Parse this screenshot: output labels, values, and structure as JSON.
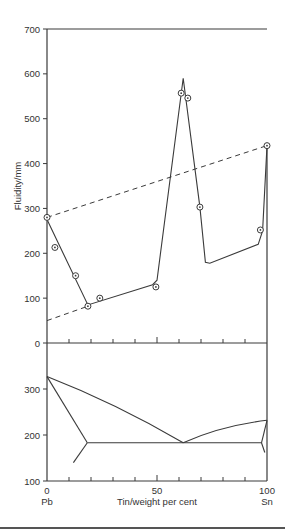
{
  "chart_data": [
    {
      "type": "scatter",
      "title": "",
      "xlabel": "Tin/weight per cent",
      "ylabel": "Fluidity/mm",
      "xlim": [
        0,
        100
      ],
      "ylim": [
        0,
        700
      ],
      "yticks": [
        0,
        100,
        200,
        300,
        400,
        500,
        600,
        700
      ],
      "ytick_labels": [
        "0",
        "100",
        "200",
        "300",
        "400",
        "500",
        "600",
        "700"
      ],
      "xticks": [
        0,
        10,
        20,
        30,
        40,
        50,
        60,
        70,
        80,
        90,
        100
      ],
      "grid": false,
      "series": [
        {
          "name": "measured fluidity",
          "style": "markers",
          "x": [
            0,
            3.6,
            13,
            18.6,
            24,
            49.5,
            61,
            64,
            69.5,
            97,
            100
          ],
          "y": [
            280,
            213,
            150,
            82,
            100,
            125,
            557,
            546,
            303,
            252,
            440
          ]
        },
        {
          "name": "fluidity curve",
          "style": "solid",
          "x": [
            0,
            18.6,
            48,
            50,
            61.9,
            69.5,
            72,
            74,
            96,
            98,
            100
          ],
          "y": [
            275,
            85,
            130,
            140,
            590,
            303,
            180,
            178,
            220,
            250,
            440
          ]
        },
        {
          "name": "upper linear trend",
          "style": "dashed",
          "x": [
            0,
            100
          ],
          "y": [
            280,
            440
          ]
        },
        {
          "name": "lower linear trend",
          "style": "dashed",
          "x": [
            0,
            18.6
          ],
          "y": [
            50,
            82
          ]
        }
      ]
    },
    {
      "type": "line",
      "title": "Pb-Sn phase diagram",
      "xlabel": "Tin/weight per cent",
      "ylabel": "",
      "xlim": [
        0,
        100
      ],
      "ylim": [
        100,
        350
      ],
      "yticks": [
        100,
        200,
        300
      ],
      "ytick_labels": [
        "100",
        "200",
        "300"
      ],
      "xticks": [
        0,
        10,
        20,
        30,
        40,
        50,
        60,
        70,
        80,
        90,
        100
      ],
      "xtick_labels": [
        "0",
        "50",
        "100"
      ],
      "x_end_labels": [
        "Pb",
        "Sn"
      ],
      "grid": false,
      "series": [
        {
          "name": "liquidus Pb side",
          "x": [
            0,
            61.9
          ],
          "y": [
            327,
            183
          ]
        },
        {
          "name": "liquidus Sn side",
          "x": [
            61.9,
            100
          ],
          "y": [
            183,
            232
          ]
        },
        {
          "name": "solidus Pb side",
          "x": [
            0,
            18.3
          ],
          "y": [
            327,
            183
          ]
        },
        {
          "name": "solvus Pb side",
          "x": [
            18.3,
            12
          ],
          "y": [
            183,
            140
          ]
        },
        {
          "name": "eutectic line",
          "x": [
            18.3,
            97.5
          ],
          "y": [
            183,
            183
          ]
        },
        {
          "name": "solidus Sn side",
          "x": [
            97.5,
            100
          ],
          "y": [
            183,
            232
          ]
        },
        {
          "name": "solvus Sn side",
          "x": [
            97.5,
            99
          ],
          "y": [
            183,
            162
          ]
        }
      ]
    }
  ]
}
